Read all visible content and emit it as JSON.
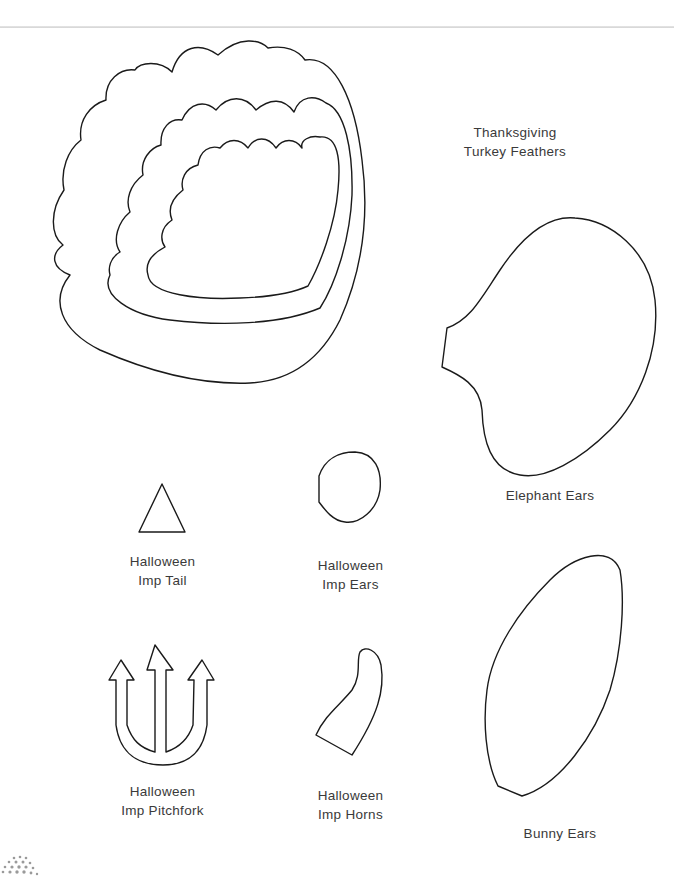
{
  "page": {
    "type": "craft-template-sheet",
    "stroke_color": "#1a1a1a",
    "text_color": "#3a3a3a"
  },
  "templates": [
    {
      "id": "turkey",
      "line1": "Thanksgiving",
      "line2": "Turkey Feathers",
      "icon": "turkey-feathers-icon"
    },
    {
      "id": "elephant",
      "line1": "Elephant Ears",
      "line2": "",
      "icon": "elephant-ear-icon"
    },
    {
      "id": "imp-tail",
      "line1": "Halloween",
      "line2": "Imp Tail",
      "icon": "triangle-tail-icon"
    },
    {
      "id": "imp-ears",
      "line1": "Halloween",
      "line2": "Imp Ears",
      "icon": "imp-ear-icon"
    },
    {
      "id": "imp-pitchfork",
      "line1": "Halloween",
      "line2": "Imp Pitchfork",
      "icon": "pitchfork-icon"
    },
    {
      "id": "imp-horns",
      "line1": "Halloween",
      "line2": "Imp Horns",
      "icon": "horn-icon"
    },
    {
      "id": "bunny",
      "line1": "Bunny Ears",
      "line2": "",
      "icon": "bunny-ear-icon"
    }
  ]
}
